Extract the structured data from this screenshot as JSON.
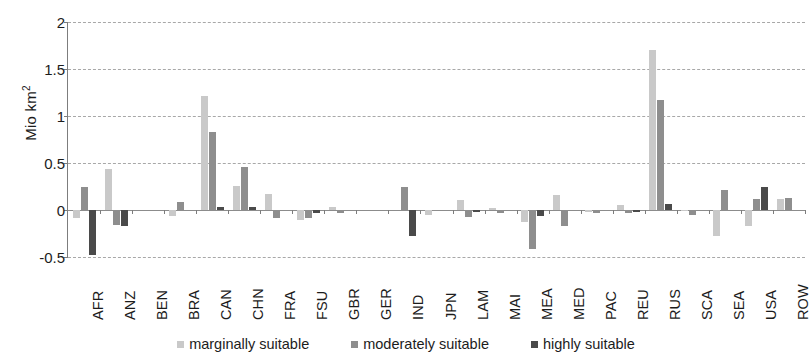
{
  "chart_data": {
    "type": "bar",
    "title": "",
    "xlabel": "",
    "ylabel": "Mio km²",
    "ylabel_text": "Mio km",
    "ylabel_sup": "2",
    "ylim": [
      -0.5,
      2
    ],
    "yticks": [
      -0.5,
      0,
      0.5,
      1,
      1.5,
      2
    ],
    "ytick_labels": [
      "-0.5",
      "0",
      "0.5",
      "1",
      "1.5",
      "2"
    ],
    "grid": true,
    "grid_style": "dashed horizontal",
    "legend_position": "bottom-center",
    "categories": [
      "AFR",
      "ANZ",
      "BEN",
      "BRA",
      "CAN",
      "CHN",
      "FRA",
      "FSU",
      "GBR",
      "GER",
      "IND",
      "JPN",
      "LAM",
      "MAI",
      "MEA",
      "MED",
      "PAC",
      "REU",
      "RUS",
      "SCA",
      "SEA",
      "USA",
      "ROW"
    ],
    "series": [
      {
        "name": "marginally suitable",
        "color": "#c9c9c9",
        "values": [
          -0.08,
          0.44,
          0.0,
          -0.06,
          1.21,
          0.26,
          0.17,
          -0.11,
          0.03,
          0.0,
          0.0,
          -0.05,
          0.11,
          0.02,
          -0.13,
          0.16,
          -0.02,
          0.05,
          1.7,
          -0.01,
          -0.28,
          -0.17,
          0.12
        ]
      },
      {
        "name": "moderately suitable",
        "color": "#8e8e8e",
        "values": [
          0.25,
          -0.16,
          0.0,
          0.09,
          0.83,
          0.46,
          -0.09,
          -0.09,
          -0.03,
          0.0,
          0.24,
          -0.01,
          -0.07,
          -0.03,
          -0.42,
          -0.17,
          -0.03,
          -0.03,
          1.17,
          -0.05,
          0.21,
          0.12,
          0.13
        ]
      },
      {
        "name": "highly suitable",
        "color": "#4a4a4a",
        "values": [
          -0.48,
          -0.17,
          0.0,
          0.0,
          0.03,
          0.03,
          0.0,
          -0.03,
          0.0,
          0.0,
          -0.28,
          0.0,
          -0.02,
          0.0,
          -0.06,
          0.0,
          0.0,
          -0.02,
          0.06,
          0.0,
          0.0,
          0.25,
          0.0
        ]
      }
    ]
  },
  "legend": {
    "items": [
      {
        "label": "marginally suitable",
        "color": "#c9c9c9"
      },
      {
        "label": "moderately suitable",
        "color": "#8e8e8e"
      },
      {
        "label": "highly suitable",
        "color": "#4a4a4a"
      }
    ]
  }
}
